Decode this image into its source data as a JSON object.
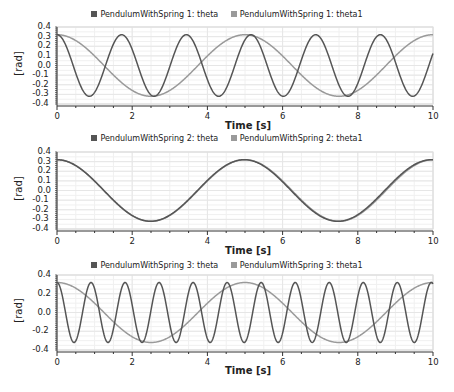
{
  "colors": {
    "theta": "#555555",
    "theta1": "#9a9a9a",
    "grid": "#e6e6e6",
    "axis": "#333333"
  },
  "chart_data": [
    {
      "type": "line",
      "title": "",
      "legend": [
        "PendulumWithSpring 1: theta",
        "PendulumWithSpring 1: theta1"
      ],
      "xlabel": "Time [s]",
      "ylabel": "[rad]",
      "xlim": [
        0,
        10
      ],
      "ylim": [
        -0.4,
        0.4
      ],
      "xticks": [
        "0",
        "2",
        "4",
        "6",
        "8",
        "10"
      ],
      "yticks": [
        "0.4",
        "0.3",
        "0.2",
        "0.1",
        "0.0",
        "-0.1",
        "-0.2",
        "-0.3",
        "-0.4"
      ],
      "grid": true,
      "series": [
        {
          "name": "PendulumWithSpring 1: theta",
          "amplitude": 0.32,
          "period": 1.72,
          "shape": "cosine"
        },
        {
          "name": "PendulumWithSpring 1: theta1",
          "amplitude": 0.32,
          "period": 5.0,
          "shape": "cosine"
        }
      ]
    },
    {
      "type": "line",
      "title": "",
      "legend": [
        "PendulumWithSpring 2: theta",
        "PendulumWithSpring 2: theta1"
      ],
      "xlabel": "Time [s]",
      "ylabel": "[rad]",
      "xlim": [
        0,
        10
      ],
      "ylim": [
        -0.4,
        0.4
      ],
      "xticks": [
        "0",
        "2",
        "4",
        "6",
        "8",
        "10"
      ],
      "yticks": [
        "0.4",
        "0.3",
        "0.2",
        "0.1",
        "0.0",
        "-0.1",
        "-0.2",
        "-0.3",
        "-0.4"
      ],
      "grid": true,
      "series": [
        {
          "name": "PendulumWithSpring 2: theta",
          "amplitude": 0.32,
          "period": 4.98,
          "shape": "cosine"
        },
        {
          "name": "PendulumWithSpring 2: theta1",
          "amplitude": 0.32,
          "period": 5.0,
          "shape": "cosine"
        }
      ]
    },
    {
      "type": "line",
      "title": "",
      "legend": [
        "PendulumWithSpring 3: theta",
        "PendulumWithSpring 3: theta1"
      ],
      "xlabel": "Time [s]",
      "ylabel": "[rad]",
      "xlim": [
        0,
        10
      ],
      "ylim": [
        -0.4,
        0.4
      ],
      "xticks": [
        "0",
        "2",
        "4",
        "6",
        "8",
        "10"
      ],
      "yticks": [
        "0.4",
        "0.2",
        "0.0",
        "-0.2",
        "-0.4"
      ],
      "grid": true,
      "series": [
        {
          "name": "PendulumWithSpring 3: theta",
          "amplitude": 0.32,
          "period": 0.905,
          "shape": "cosine"
        },
        {
          "name": "PendulumWithSpring 3: theta1",
          "amplitude": 0.32,
          "period": 5.0,
          "shape": "cosine"
        }
      ]
    }
  ]
}
